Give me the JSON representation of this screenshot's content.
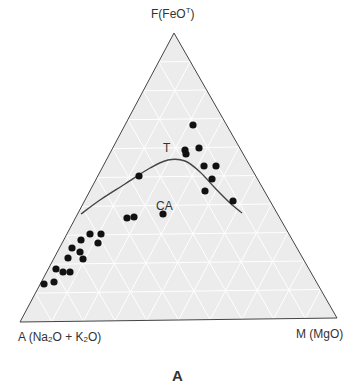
{
  "chart_data": {
    "type": "scatter",
    "subtype": "ternary",
    "title": "A",
    "vertices": {
      "top": "F(FeOᵀ)",
      "bottom_left": "A (Na₂O + K₂O)",
      "bottom_right": "M (MgO)"
    },
    "vertex_labels": {
      "top_main": "F(FeO",
      "top_sup": "T",
      "top_close": ")",
      "left": "A (Na",
      "left_sub1": "2",
      "left_mid": "O + K",
      "left_sub2": "2",
      "left_end": "O)",
      "right": "M (MgO)"
    },
    "field_labels": [
      {
        "text": "T",
        "name": "tholeiitic"
      },
      {
        "text": "CA",
        "name": "calc-alkaline"
      }
    ],
    "grid": true,
    "pixel_geometry": {
      "top": [
        174,
        33
      ],
      "left": [
        20,
        322
      ],
      "right": [
        337,
        318
      ]
    },
    "boundary_curve": [
      [
        81,
        214
      ],
      [
        100,
        200
      ],
      [
        125,
        184
      ],
      [
        150,
        168
      ],
      [
        168,
        160
      ],
      [
        185,
        161
      ],
      [
        200,
        172
      ],
      [
        215,
        188
      ],
      [
        230,
        203
      ],
      [
        242,
        213
      ]
    ],
    "points": [
      [
        193,
        125
      ],
      [
        185,
        150
      ],
      [
        186,
        154
      ],
      [
        199,
        148
      ],
      [
        204,
        166
      ],
      [
        216,
        166
      ],
      [
        212,
        179
      ],
      [
        205,
        191
      ],
      [
        233,
        201
      ],
      [
        139,
        176
      ],
      [
        127,
        218
      ],
      [
        134,
        217
      ],
      [
        163,
        214
      ],
      [
        90,
        234
      ],
      [
        101,
        234
      ],
      [
        81,
        240
      ],
      [
        98,
        243
      ],
      [
        72,
        248
      ],
      [
        80,
        252
      ],
      [
        68,
        258
      ],
      [
        83,
        259
      ],
      [
        56,
        269
      ],
      [
        63,
        272
      ],
      [
        70,
        272
      ],
      [
        44,
        284
      ],
      [
        54,
        282
      ]
    ],
    "colors": {
      "fill": "#ececec",
      "grid": "#ffffff",
      "outline": "#444444",
      "points": "#111111",
      "curve": "#444444"
    }
  },
  "caption": "A"
}
